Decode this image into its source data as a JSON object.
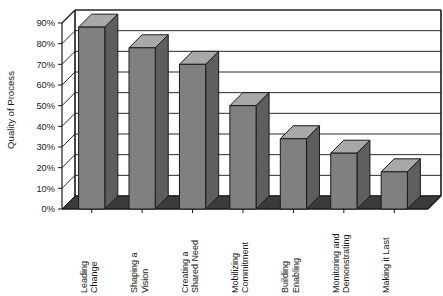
{
  "chart_data": {
    "type": "bar",
    "title": "",
    "subtitle": "",
    "xlabel": "",
    "ylabel": "Quality of Process",
    "ylim": [
      0,
      90
    ],
    "ytick_step": 10,
    "grid": true,
    "legend": "none",
    "three_d": true,
    "orientation": "vertical",
    "categories": [
      "Leading Change",
      "Shaping a Vision",
      "Creating a Shared Need",
      "Mobilizing Commitment",
      "Building Enabling",
      "Monitoring and Demonstrating",
      "Making it Last"
    ],
    "category_lines": [
      [
        "Leading",
        "Change"
      ],
      [
        "Shaping a",
        "Vision"
      ],
      [
        "Creating a",
        "Shared Need"
      ],
      [
        "Mobilizing",
        "Commitment"
      ],
      [
        "Building",
        "Enabling"
      ],
      [
        "Monitoring and",
        "Demonstrating"
      ],
      [
        "Making it Last"
      ]
    ],
    "values": [
      88,
      78,
      70,
      50,
      34,
      27,
      18
    ],
    "value_labels": [
      "88%",
      "78%",
      "70%",
      "50%",
      "34%",
      "27%",
      "18%"
    ],
    "ytick_labels": [
      "0%",
      "10%",
      "20%",
      "30%",
      "40%",
      "50%",
      "60%",
      "70%",
      "80%",
      "90%"
    ],
    "ytick_values": [
      0,
      10,
      20,
      30,
      40,
      50,
      60,
      70,
      80,
      90
    ],
    "colors": {
      "bar_front": "#808080",
      "bar_top": "#a8a8a8",
      "bar_side": "#5e5e5e",
      "floor": "#3b3b3b",
      "wall": "#ffffff",
      "gridline": "#2b2b2b",
      "axis": "#1a1a1a",
      "background": "#ffffff",
      "text": "#1a1a1a"
    }
  }
}
